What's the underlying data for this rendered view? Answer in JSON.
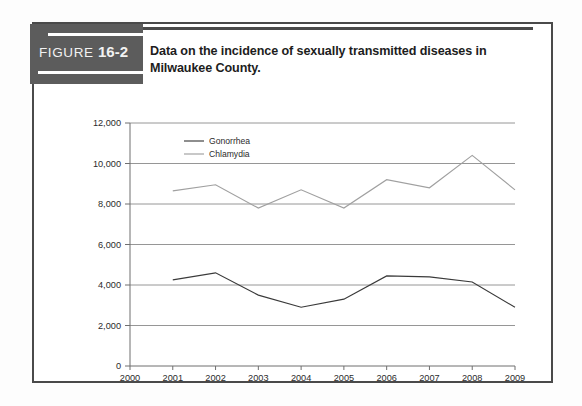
{
  "figure": {
    "tag_word": "FIGURE",
    "tag_number": "16-2",
    "caption": "Data on the incidence of sexually transmitted diseases in Milwaukee County."
  },
  "colors": {
    "frame_border": "#4a4a4a",
    "tag_background": "#5c5c5c",
    "tag_text": "#f2f2f2",
    "caption_text": "#1d1d1d",
    "gridline": "#8a8a8a",
    "axis": "#6f6f6f",
    "gonorrhea_line": "#3a3a3a",
    "chlamydia_line": "#a0a0a0"
  },
  "chart_data": {
    "type": "line",
    "title": "Data on the incidence of sexually transmitted diseases in Milwaukee County.",
    "xlabel": "",
    "ylabel": "",
    "x": [
      2000,
      2001,
      2002,
      2003,
      2004,
      2005,
      2006,
      2007,
      2008,
      2009
    ],
    "categories": [
      "2000",
      "2001",
      "2002",
      "2003",
      "2004",
      "2005",
      "2006",
      "2007",
      "2008",
      "2009"
    ],
    "xlim": [
      2000,
      2009
    ],
    "ylim": [
      0,
      12000
    ],
    "ytick_labels": [
      "0",
      "2,000",
      "4,000",
      "6,000",
      "8,000",
      "10,000",
      "12,000"
    ],
    "yticks": [
      0,
      2000,
      4000,
      6000,
      8000,
      10000,
      12000
    ],
    "grid": true,
    "grid_axis": "y",
    "legend_position": "top-left-inside",
    "series": [
      {
        "name": "Gonorrhea",
        "color": "#3a3a3a",
        "x": [
          2001,
          2002,
          2003,
          2004,
          2005,
          2006,
          2007,
          2008,
          2009
        ],
        "values": [
          4250,
          4600,
          3500,
          2900,
          3300,
          4450,
          4400,
          4150,
          2900
        ]
      },
      {
        "name": "Chlamydia",
        "color": "#a0a0a0",
        "x": [
          2001,
          2002,
          2003,
          2004,
          2005,
          2006,
          2007,
          2008,
          2009
        ],
        "values": [
          8650,
          8950,
          7800,
          8700,
          7800,
          9200,
          8800,
          10400,
          8700
        ]
      }
    ]
  }
}
